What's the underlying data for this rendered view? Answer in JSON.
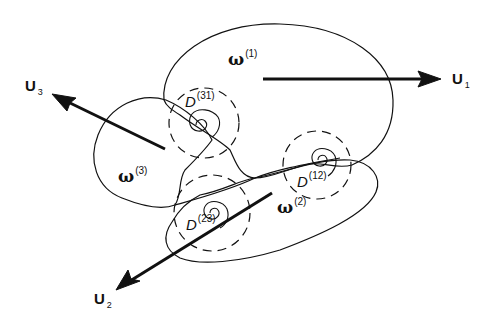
{
  "diagram": {
    "regions": [
      {
        "id": "omega1",
        "symbol": "ω",
        "index": "(1)"
      },
      {
        "id": "omega2",
        "symbol": "ω",
        "index": "(2)"
      },
      {
        "id": "omega3",
        "symbol": "ω",
        "index": "(3)"
      }
    ],
    "contact_zones": [
      {
        "id": "D31",
        "symbol": "D",
        "index": "(31)"
      },
      {
        "id": "D12",
        "symbol": "D",
        "index": "(12)"
      },
      {
        "id": "D23",
        "symbol": "D",
        "index": "(23)"
      }
    ],
    "velocities": [
      {
        "id": "U1",
        "symbol": "U",
        "index": "1"
      },
      {
        "id": "U2",
        "symbol": "U",
        "index": "2"
      },
      {
        "id": "U3",
        "symbol": "U",
        "index": "3"
      }
    ],
    "colors": {
      "stroke": "#111111",
      "background": "#ffffff"
    }
  }
}
